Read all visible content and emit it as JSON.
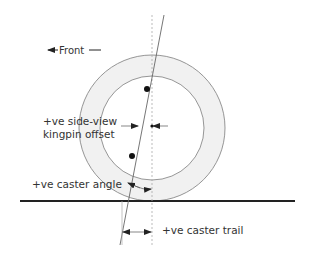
{
  "labels": {
    "front": "Front",
    "side_view_offset_line1": "+ve side-view",
    "side_view_offset_line2": "kingpin offset",
    "caster_angle": "+ve caster angle",
    "caster_trail": "+ve caster trail"
  },
  "geometry": {
    "wheel_center": [
      152,
      128
    ],
    "tyre_outer_radius": 73,
    "tyre_inner_radius": 52,
    "ground_y": 201,
    "ground_x_range": [
      20,
      295
    ],
    "wheel_vertical_axis_x": 152,
    "kingpin_axis_top": [
      164,
      15
    ],
    "kingpin_axis_bottom": [
      120,
      245
    ],
    "kingpin_points": [
      [
        147,
        89
      ],
      [
        132,
        156
      ]
    ]
  },
  "colors": {
    "tyre_fill": "#f1f1f1",
    "tyre_stroke": "#8a8a8a",
    "ground_line": "#222222",
    "axis_line": "#999999",
    "text": "#333333",
    "dot": "#111111"
  },
  "arrows": [
    {
      "name": "front-direction",
      "direction": "left"
    },
    {
      "name": "kingpin-offset",
      "direction": "inward"
    },
    {
      "name": "caster-angle",
      "direction": "arc"
    },
    {
      "name": "caster-trail",
      "direction": "inward"
    }
  ]
}
